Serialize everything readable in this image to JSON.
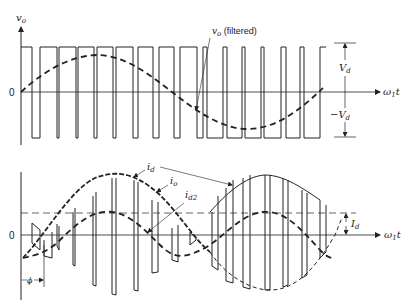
{
  "figure": {
    "type": "pwm-inverter-waveforms",
    "colors": {
      "ink": "#222222",
      "background": "#ffffff"
    }
  },
  "top_plot": {
    "y_axis_label": "v",
    "y_axis_label_sub": "o",
    "origin_label": "0",
    "x_axis_label": "ω",
    "x_axis_label_sub": "1",
    "x_axis_label_tail": "t",
    "filtered_label": "v",
    "filtered_label_sub": "o",
    "filtered_label_tail": " (filtered)",
    "pos_level_label": "V",
    "pos_level_sub": "d",
    "neg_level_label": "−V",
    "neg_level_sub": "d"
  },
  "bottom_plot": {
    "origin_label": "0",
    "x_axis_label": "ω",
    "x_axis_label_sub": "1",
    "x_axis_label_tail": "t",
    "id_label": "i",
    "id_label_sub": "d",
    "io_label": "i",
    "io_label_sub": "o",
    "id2_label": "i",
    "id2_label_sub": "d2",
    "Id_label": "I",
    "Id_label_sub": "d",
    "phase_label": "ϕ"
  }
}
